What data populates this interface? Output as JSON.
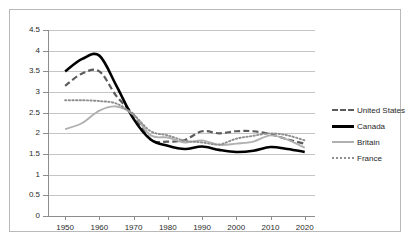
{
  "chart_data": {
    "type": "line",
    "title": "",
    "subtitle": "",
    "xlabel": "",
    "ylabel": "",
    "xlim": [
      1945,
      2023
    ],
    "ylim": [
      0,
      4.5
    ],
    "grid": true,
    "legend_position": "right",
    "x_ticks": [
      "1950",
      "1960",
      "1970",
      "1980",
      "1990",
      "2000",
      "2010",
      "2020"
    ],
    "x_tick_values": [
      1950,
      1960,
      1970,
      1980,
      1990,
      2000,
      2010,
      2020
    ],
    "y_ticks": [
      "0",
      "0.5",
      "1",
      "1.5",
      "2",
      "2.5",
      "3",
      "3.5",
      "4",
      "4.5"
    ],
    "y_tick_values": [
      0,
      0.5,
      1,
      1.5,
      2,
      2.5,
      3,
      3.5,
      4,
      4.5
    ],
    "x": [
      1950,
      1955,
      1960,
      1965,
      1970,
      1975,
      1980,
      1985,
      1990,
      1995,
      2000,
      2005,
      2010,
      2015,
      2020
    ],
    "series": [
      {
        "name": "United States",
        "style": "dashed",
        "color": "#5b5b5b",
        "values": [
          3.15,
          3.45,
          3.5,
          2.9,
          2.45,
          1.85,
          1.8,
          1.84,
          2.05,
          2.0,
          2.05,
          2.05,
          1.98,
          1.85,
          1.75
        ]
      },
      {
        "name": "Canada",
        "style": "solid",
        "color": "#000000",
        "values": [
          3.5,
          3.8,
          3.88,
          3.15,
          2.35,
          1.85,
          1.7,
          1.62,
          1.68,
          1.6,
          1.55,
          1.58,
          1.67,
          1.62,
          1.55
        ]
      },
      {
        "name": "Britain",
        "style": "solid",
        "color": "#b0b0b0",
        "values": [
          2.1,
          2.25,
          2.55,
          2.65,
          2.45,
          1.95,
          1.9,
          1.78,
          1.83,
          1.72,
          1.75,
          1.8,
          1.95,
          1.85,
          1.65
        ]
      },
      {
        "name": "France",
        "style": "dotted",
        "color": "#8f8f8f",
        "values": [
          2.8,
          2.8,
          2.78,
          2.72,
          2.45,
          2.05,
          1.95,
          1.82,
          1.78,
          1.73,
          1.87,
          1.94,
          2.0,
          1.95,
          1.83
        ]
      }
    ]
  },
  "legend": {
    "items": [
      {
        "label": "United States",
        "swatch": "dashed-line-swatch"
      },
      {
        "label": "Canada",
        "swatch": "solid-black-line-swatch"
      },
      {
        "label": "Britain",
        "swatch": "solid-gray-line-swatch"
      },
      {
        "label": "France",
        "swatch": "dotted-line-swatch"
      }
    ]
  }
}
